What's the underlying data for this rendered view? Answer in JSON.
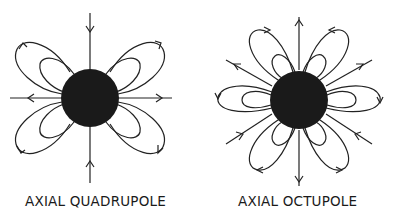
{
  "figures": [
    {
      "id": "quadrupole",
      "label": "AXIAL QUADRUPOLE",
      "center": [
        90,
        98
      ],
      "core_radius": 29,
      "core_color": "#1a1a1a"
    },
    {
      "id": "octupole",
      "label": "AXIAL OCTUPOLE",
      "center": [
        299,
        100
      ],
      "core_radius": 29,
      "core_color": "#1a1a1a"
    }
  ]
}
